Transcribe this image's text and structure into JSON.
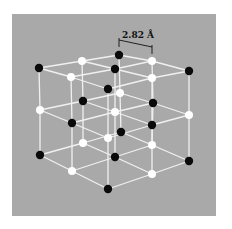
{
  "figure": {
    "background_color": "#a9a9a9",
    "page_color": "#ffffff",
    "bond_color": "#f2f2f2",
    "anion_color": "#ffffff",
    "cation_color": "#0a0a0a",
    "dimension": {
      "label": "2.82 Å"
    }
  },
  "chart_data": {
    "type": "diagram",
    "annotation": "2.82 Å",
    "layers": [
      {
        "name": "top",
        "atoms": [
          {
            "x": 119,
            "y": 55,
            "c": "black"
          },
          {
            "x": 82,
            "y": 61,
            "c": "white"
          },
          {
            "x": 152,
            "y": 61,
            "c": "white"
          },
          {
            "x": 39,
            "y": 68,
            "c": "black"
          },
          {
            "x": 115,
            "y": 69,
            "c": "black"
          },
          {
            "x": 189,
            "y": 71,
            "c": "black"
          },
          {
            "x": 71,
            "y": 77,
            "c": "white"
          },
          {
            "x": 152,
            "y": 78,
            "c": "white"
          },
          {
            "x": 108,
            "y": 89,
            "c": "black"
          }
        ]
      },
      {
        "name": "middle",
        "atoms": [
          {
            "x": 120,
            "y": 93,
            "c": "white"
          },
          {
            "x": 83,
            "y": 101,
            "c": "black"
          },
          {
            "x": 153,
            "y": 103,
            "c": "black"
          },
          {
            "x": 40,
            "y": 110,
            "c": "white"
          },
          {
            "x": 115,
            "y": 112,
            "c": "white"
          },
          {
            "x": 189,
            "y": 115,
            "c": "white"
          },
          {
            "x": 72,
            "y": 123,
            "c": "black"
          },
          {
            "x": 152,
            "y": 125,
            "c": "black"
          },
          {
            "x": 108,
            "y": 138,
            "c": "white"
          }
        ]
      },
      {
        "name": "bottom",
        "atoms": [
          {
            "x": 121,
            "y": 132,
            "c": "black"
          },
          {
            "x": 83,
            "y": 143,
            "c": "white"
          },
          {
            "x": 152,
            "y": 145,
            "c": "white"
          },
          {
            "x": 40,
            "y": 155,
            "c": "black"
          },
          {
            "x": 115,
            "y": 157,
            "c": "black"
          },
          {
            "x": 189,
            "y": 161,
            "c": "black"
          },
          {
            "x": 72,
            "y": 171,
            "c": "white"
          },
          {
            "x": 152,
            "y": 174,
            "c": "white"
          },
          {
            "x": 108,
            "y": 189,
            "c": "black"
          }
        ]
      }
    ]
  }
}
